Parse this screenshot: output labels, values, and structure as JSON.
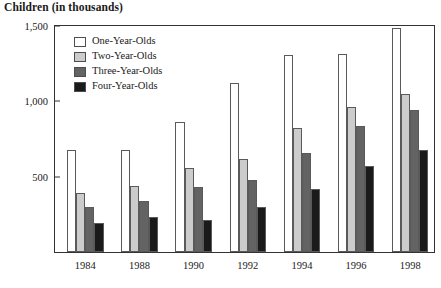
{
  "chart_data": {
    "type": "bar",
    "title": "Children (in thousands)",
    "xlabel": "",
    "ylabel": "",
    "ylim": [
      0,
      1500
    ],
    "yticks": [
      0,
      500,
      1000,
      1500
    ],
    "ytick_labels": [
      "",
      "500",
      "1,000",
      "1,500"
    ],
    "grid": false,
    "legend_position": "top-left inside",
    "categories": [
      "1984",
      "1988",
      "1990",
      "1992",
      "1994",
      "1996",
      "1998"
    ],
    "series": [
      {
        "name": "One-Year-Olds",
        "color": "#ffffff",
        "values": [
          680,
          680,
          860,
          1120,
          1310,
          1315,
          1490
        ]
      },
      {
        "name": "Two-Year-Olds",
        "color": "#cccccc",
        "values": [
          390,
          440,
          560,
          620,
          820,
          960,
          1050
        ]
      },
      {
        "name": "Three-Year-Olds",
        "color": "#636363",
        "values": [
          300,
          340,
          430,
          480,
          660,
          835,
          945
        ]
      },
      {
        "name": "Four-Year-Olds",
        "color": "#1a1a1a",
        "values": [
          190,
          230,
          215,
          300,
          415,
          570,
          675
        ]
      }
    ]
  }
}
